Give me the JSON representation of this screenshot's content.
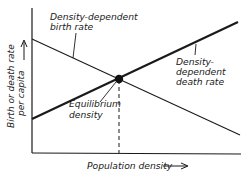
{
  "diagram": {
    "type": "line-graph-sketch",
    "axes": {
      "x_label": "Population density",
      "y_label_line1": "Birth or death rate",
      "y_label_line2": "per capita"
    },
    "curves": [
      {
        "name": "Density-dependent birth rate",
        "label_line1": "Density-dependent",
        "label_line2": "birth rate",
        "trend": "decreasing",
        "style": "thin"
      },
      {
        "name": "Density-dependent death rate",
        "label_line1": "Density-",
        "label_line2": "dependent",
        "label_line3": "death rate",
        "trend": "increasing",
        "style": "thick"
      }
    ],
    "equilibrium": {
      "label_line1": "Equilibrium",
      "label_line2": "density",
      "marker": "filled-dot",
      "guide": "dashed-vertical-to-x-axis"
    },
    "colors": {
      "ink": "#1a1a1a",
      "background": "#ffffff"
    }
  }
}
